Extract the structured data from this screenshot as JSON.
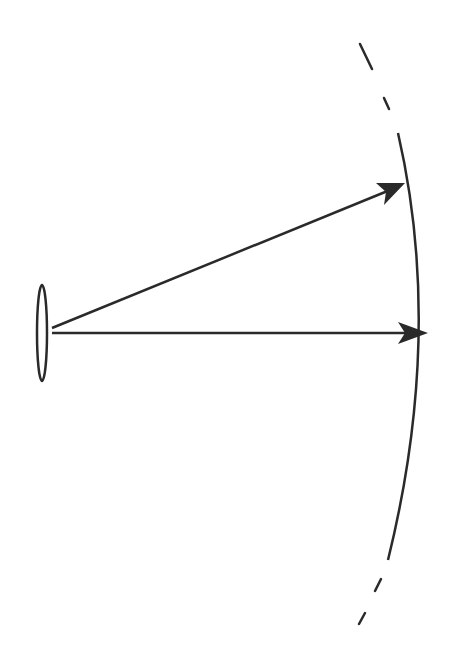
{
  "diagram": {
    "type": "optics-schematic",
    "description": "Lens at left emitting two rays (arrows) to a curved wavefront/focal surface at right",
    "colors": {
      "background": "#ffffff",
      "stroke": "#2a2a2a"
    },
    "elements": {
      "lens": {
        "shape": "ellipse",
        "cx": 42,
        "cy": 333,
        "rx": 5,
        "ry": 48
      },
      "rays": [
        {
          "name": "axial-ray",
          "x1": 52,
          "y1": 333,
          "x2": 428,
          "y2": 333
        },
        {
          "name": "oblique-ray",
          "x1": 52,
          "y1": 328,
          "x2": 405,
          "y2": 183
        }
      ],
      "arc": {
        "style": "solid-center-dashed-ends",
        "solid_top": [
          398,
          133
        ],
        "apex": [
          430,
          333
        ],
        "solid_bottom": [
          388,
          560
        ]
      }
    },
    "labels": []
  }
}
